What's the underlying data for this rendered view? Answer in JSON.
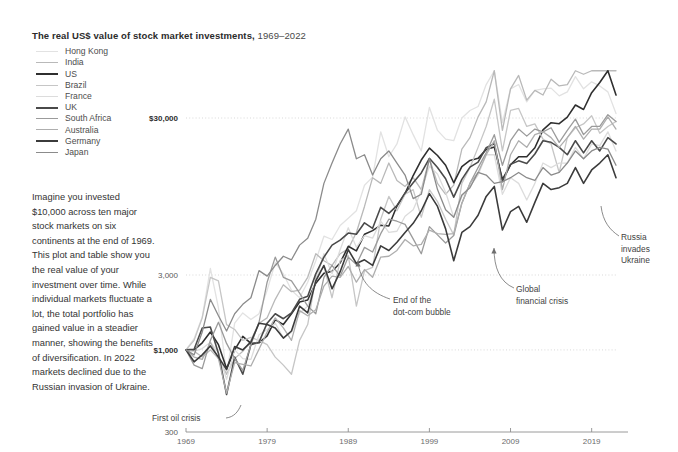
{
  "header": {
    "title_main": "The real US$ value of stock market investments,",
    "title_years": "1969–2022"
  },
  "blurb": {
    "text": "Imagine you invested $10,000 across ten major stock markets on six continents at the end of 1969. This plot and table show you the real value of your investment over time. While individual markets fluctuate a lot, the total portfolio has gained value in a steadier manner, showing the benefits of diversification. In 2022 markets declined due to the Russian invasion of Ukraine."
  },
  "legend": {
    "items": [
      {
        "label": "Hong Kong",
        "color": "#e2e2e2",
        "width": 1.8
      },
      {
        "label": "India",
        "color": "#b9b9b9",
        "width": 1.8
      },
      {
        "label": "US",
        "color": "#2f2f2f",
        "width": 2.2
      },
      {
        "label": "Brazil",
        "color": "#c6c6c6",
        "width": 1.8
      },
      {
        "label": "France",
        "color": "#dcdcdc",
        "width": 1.8
      },
      {
        "label": "UK",
        "color": "#4a4a4a",
        "width": 2.2
      },
      {
        "label": "South Africa",
        "color": "#9b9b9b",
        "width": 1.8
      },
      {
        "label": "Australia",
        "color": "#aeaeae",
        "width": 1.8
      },
      {
        "label": "Germany",
        "color": "#3b3b3b",
        "width": 2.2
      },
      {
        "label": "Japan",
        "color": "#8b8b8b",
        "width": 1.8
      }
    ]
  },
  "axes": {
    "y_ticks": [
      {
        "label": "$30,000",
        "value": 30000,
        "bold": true
      },
      {
        "label": "3,000",
        "value": 3000,
        "bold": false
      },
      {
        "label": "$1,000",
        "value": 1000,
        "bold": true
      },
      {
        "label": "300",
        "value": 300,
        "bold": false
      }
    ],
    "x_ticks": [
      "1969",
      "1979",
      "1989",
      "1999",
      "2009",
      "2019"
    ]
  },
  "annotations": [
    {
      "name": "first-oil-crisis",
      "lines": [
        "First oil crisis"
      ]
    },
    {
      "name": "end-dotcom-bubble",
      "lines": [
        "End of the",
        "dot-com bubble"
      ]
    },
    {
      "name": "global-financial-crisis",
      "lines": [
        "Global",
        "financial crisis"
      ]
    },
    {
      "name": "russia-invades-ukraine",
      "lines": [
        "Russia",
        "invades",
        "Ukraine"
      ]
    }
  ],
  "chart_data": {
    "type": "line",
    "title": "The real US$ value of stock market investments, 1969–2022",
    "xlabel": "",
    "ylabel": "Real US$ value of $1,000 invested at end of 1969",
    "yscale": "log",
    "ylim": [
      300,
      60000
    ],
    "xlim": [
      1969,
      2022
    ],
    "grid": true,
    "legend_position": "top-left",
    "x": [
      1969,
      1970,
      1971,
      1972,
      1973,
      1974,
      1975,
      1976,
      1977,
      1978,
      1979,
      1980,
      1981,
      1982,
      1983,
      1984,
      1985,
      1986,
      1987,
      1988,
      1989,
      1990,
      1991,
      1992,
      1993,
      1994,
      1995,
      1996,
      1997,
      1998,
      1999,
      2000,
      2001,
      2002,
      2003,
      2004,
      2005,
      2006,
      2007,
      2008,
      2009,
      2010,
      2011,
      2012,
      2013,
      2014,
      2015,
      2016,
      2017,
      2018,
      2019,
      2020,
      2021,
      2022
    ],
    "series": [
      {
        "name": "Hong Kong",
        "color": "#e2e2e2",
        "values": [
          1000,
          1180,
          1620,
          3300,
          1850,
          700,
          1480,
          1720,
          1560,
          1700,
          2400,
          3600,
          3050,
          2400,
          2150,
          2700,
          3700,
          5300,
          5050,
          6200,
          6900,
          7700,
          11200,
          12600,
          24500,
          17000,
          20500,
          30500,
          23500,
          18500,
          35000,
          25000,
          22000,
          21500,
          30000,
          33500,
          35500,
          49000,
          63000,
          28000,
          46000,
          49000,
          38000,
          45000,
          46000,
          46500,
          41500,
          44000,
          55000,
          46000,
          51000,
          48000,
          44000,
          32000
        ]
      },
      {
        "name": "India",
        "color": "#b9b9b9",
        "values": [
          1000,
          980,
          900,
          1000,
          880,
          700,
          880,
          980,
          1150,
          1480,
          1600,
          2100,
          2600,
          2350,
          2400,
          2900,
          4100,
          3700,
          3450,
          4100,
          4400,
          5600,
          8200,
          12500,
          11500,
          15500,
          12000,
          11000,
          12500,
          10500,
          16500,
          11500,
          9800,
          11200,
          19000,
          22500,
          30500,
          38000,
          62000,
          25000,
          46000,
          56000,
          39000,
          45000,
          42000,
          53000,
          48000,
          49000,
          63000,
          57000,
          62000,
          67000,
          88000,
          80000
        ]
      },
      {
        "name": "US",
        "color": "#2f2f2f",
        "values": [
          1000,
          1000,
          1110,
          1300,
          1080,
          760,
          1000,
          1220,
          1100,
          1110,
          1230,
          1560,
          1450,
          1700,
          2020,
          2080,
          2660,
          3080,
          3170,
          3580,
          4570,
          4270,
          5450,
          5750,
          6230,
          6150,
          8250,
          9900,
          12900,
          16200,
          19300,
          17300,
          15000,
          11600,
          14700,
          16100,
          16600,
          18900,
          19600,
          12200,
          15100,
          17000,
          17000,
          19400,
          25200,
          28000,
          27600,
          30400,
          36300,
          34000,
          43500,
          50500,
          63000,
          42000
        ]
      },
      {
        "name": "Brazil",
        "color": "#c6c6c6",
        "values": [
          1000,
          1150,
          1600,
          2900,
          2750,
          1450,
          1350,
          1150,
          1200,
          1150,
          1080,
          900,
          800,
          700,
          1150,
          1450,
          2900,
          3400,
          2150,
          3700,
          4000,
          1900,
          3200,
          3350,
          6800,
          9500,
          7700,
          9800,
          10500,
          7000,
          10500,
          8800,
          6800,
          5400,
          11500,
          14500,
          19500,
          26500,
          39500,
          18500,
          33500,
          34500,
          26500,
          27500,
          22000,
          20500,
          13500,
          22500,
          26000,
          27500,
          31000,
          24000,
          26500,
          28500
        ]
      },
      {
        "name": "France",
        "color": "#dcdcdc",
        "values": [
          1000,
          980,
          1020,
          1120,
          960,
          650,
          1000,
          880,
          870,
          1250,
          1350,
          1480,
          1190,
          1290,
          1720,
          1900,
          2750,
          4100,
          3050,
          4350,
          6000,
          4500,
          5350,
          5150,
          6600,
          5600,
          5700,
          7100,
          7800,
          10300,
          14800,
          13200,
          10100,
          7000,
          9500,
          11000,
          13000,
          17500,
          17500,
          9800,
          12500,
          11500,
          9000,
          11500,
          15500,
          14500,
          15500,
          15500,
          19500,
          16500,
          20500,
          20000,
          24500,
          18500
        ]
      },
      {
        "name": "UK",
        "color": "#4a4a4a",
        "values": [
          1000,
          1010,
          1380,
          1400,
          950,
          520,
          900,
          700,
          1080,
          1120,
          1480,
          1700,
          1580,
          1720,
          2100,
          2200,
          3050,
          3900,
          4650,
          5000,
          5550,
          5450,
          6450,
          5950,
          8100,
          7400,
          8300,
          10000,
          11600,
          13400,
          16600,
          14500,
          12300,
          9400,
          12200,
          14600,
          15700,
          19400,
          20600,
          11800,
          15200,
          16000,
          15400,
          17700,
          21500,
          21000,
          19500,
          17500,
          21500,
          18000,
          21500,
          18500,
          22500,
          20500
        ]
      },
      {
        "name": "South Africa",
        "color": "#9b9b9b",
        "values": [
          1000,
          800,
          760,
          1150,
          1500,
          1100,
          880,
          740,
          1080,
          1500,
          2700,
          3900,
          2900,
          2750,
          2300,
          1900,
          1700,
          2900,
          3450,
          2950,
          3900,
          3500,
          4500,
          4200,
          5500,
          6800,
          6600,
          6300,
          5100,
          4100,
          6100,
          5400,
          4800,
          5350,
          8600,
          11500,
          14500,
          18000,
          23500,
          15000,
          21500,
          25500,
          23000,
          25500,
          24500,
          26000,
          21000,
          25000,
          29500,
          23500,
          26500,
          26500,
          31500,
          28500
        ]
      },
      {
        "name": "Australia",
        "color": "#aeaeae",
        "values": [
          1000,
          900,
          870,
          1120,
          880,
          530,
          830,
          810,
          790,
          1010,
          1300,
          1600,
          1380,
          1150,
          1780,
          1650,
          1800,
          2550,
          2950,
          2900,
          3400,
          2700,
          3250,
          2900,
          3900,
          3950,
          4300,
          5050,
          4600,
          4700,
          5800,
          5500,
          5450,
          5500,
          8600,
          11500,
          13500,
          17500,
          21500,
          10500,
          17500,
          21500,
          19500,
          23500,
          24500,
          22500,
          19500,
          22500,
          26500,
          22000,
          25500,
          25500,
          30500,
          25500
        ]
      },
      {
        "name": "Germany",
        "color": "#3b3b3b",
        "values": [
          1000,
          840,
          930,
          1060,
          900,
          750,
          1050,
          1000,
          1120,
          1480,
          1450,
          1380,
          1190,
          1320,
          1900,
          1720,
          2750,
          3450,
          2450,
          3150,
          4350,
          3550,
          3750,
          3450,
          4600,
          4300,
          4850,
          5600,
          6400,
          7700,
          9900,
          8200,
          5900,
          3700,
          5600,
          6100,
          7200,
          9500,
          11000,
          5800,
          7600,
          8200,
          6500,
          8700,
          11500,
          10500,
          10800,
          11500,
          14500,
          11500,
          14000,
          15500,
          17500,
          12500
        ]
      },
      {
        "name": "Japan",
        "color": "#8b8b8b",
        "values": [
          1000,
          930,
          1300,
          2100,
          1650,
          1320,
          1700,
          1950,
          2150,
          3200,
          2950,
          3450,
          3950,
          3750,
          4650,
          5150,
          6800,
          11500,
          15500,
          20500,
          25500,
          16500,
          17500,
          13000,
          16500,
          18500,
          15500,
          13000,
          9200,
          9800,
          16500,
          10500,
          7800,
          7000,
          9700,
          10800,
          13500,
          13000,
          11500,
          11800,
          12500,
          13500,
          12500,
          12000,
          14500,
          13000,
          13500,
          15500,
          18500,
          16500,
          18500,
          19500,
          19000,
          15000
        ]
      }
    ]
  }
}
